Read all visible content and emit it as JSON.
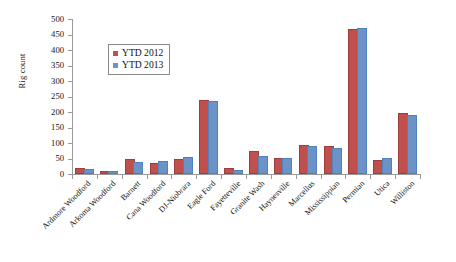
{
  "chart_data": {
    "type": "bar",
    "title": "",
    "xlabel": "",
    "ylabel": "Rig count",
    "ylim": [
      0,
      500
    ],
    "y_ticks": [
      0,
      50,
      100,
      150,
      200,
      250,
      300,
      350,
      400,
      450,
      500
    ],
    "grid": false,
    "legend_position": "upper-left-inside",
    "categories": [
      "Ardmore Woodford",
      "Arkoma Woodford",
      "Barnett",
      "Cana Woodford",
      "DJ-Niobrara",
      "Eagle Ford",
      "Fayetteville",
      "Granite Wash",
      "Haynesville",
      "Marcellus",
      "Mississippian",
      "Permian",
      "Utica",
      "Williston"
    ],
    "series": [
      {
        "name": "YTD 2012",
        "color": "#C0504D",
        "values": [
          12,
          4,
          41,
          30,
          41,
          231,
          12,
          68,
          44,
          87,
          85,
          460,
          39,
          190
        ]
      },
      {
        "name": "YTD 2013",
        "color": "#6B93C7",
        "values": [
          10,
          4,
          33,
          36,
          49,
          228,
          8,
          52,
          45,
          84,
          79,
          465,
          45,
          184
        ]
      }
    ]
  }
}
